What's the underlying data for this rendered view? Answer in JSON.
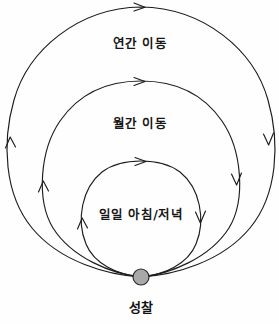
{
  "diagram": {
    "type": "cycle-loop-diagram",
    "background_color": "#fefefe",
    "stroke_color": "#1c1c1c",
    "node": {
      "label": "성찰",
      "fill_color": "#a8a8a8",
      "stroke_color": "#2b2b2b",
      "cx": 141,
      "cy": 277,
      "r": 8
    },
    "loops": [
      {
        "id": "annual",
        "label": "연간 이동",
        "label_x": 140,
        "label_y": 48,
        "cx": 141,
        "cy": 142,
        "r": 135,
        "direction": "clockwise",
        "arrow_positions": [
          "top",
          "left",
          "right"
        ]
      },
      {
        "id": "monthly",
        "label": "월간 이동",
        "label_x": 140,
        "label_y": 128,
        "cx": 141,
        "cy": 180,
        "r": 97,
        "direction": "clockwise",
        "arrow_positions": [
          "top",
          "left",
          "right"
        ]
      },
      {
        "id": "daily",
        "label": "일일 아침/저녁",
        "label_x": 141,
        "label_y": 219,
        "cx": 141,
        "cy": 220,
        "r": 58,
        "direction": "clockwise",
        "arrow_positions": [
          "top",
          "left",
          "right"
        ]
      }
    ]
  }
}
